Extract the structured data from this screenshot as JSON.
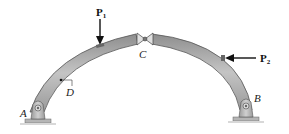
{
  "diagram": {
    "type": "three-hinged arch",
    "labels": {
      "A": "A",
      "B": "B",
      "C": "C",
      "D": "D"
    },
    "forces": [
      {
        "id": "P1",
        "symbol": "P",
        "subscript": "1",
        "direction": "down",
        "member": "left segment AC"
      },
      {
        "id": "P2",
        "symbol": "P",
        "subscript": "2",
        "direction": "left",
        "member": "right segment CB"
      }
    ],
    "supports": [
      {
        "id": "A",
        "kind": "pin"
      },
      {
        "id": "B",
        "kind": "pin"
      }
    ],
    "hinge": {
      "id": "C",
      "kind": "pin connection"
    },
    "point_of_interest": {
      "id": "D",
      "location": "on left segment AC"
    },
    "colors": {
      "member_fill": "#a9a9a9",
      "member_edge": "#555555",
      "support_fill": "#bfbfbf",
      "ground": "#c8c8c8",
      "text": "#222222"
    }
  }
}
